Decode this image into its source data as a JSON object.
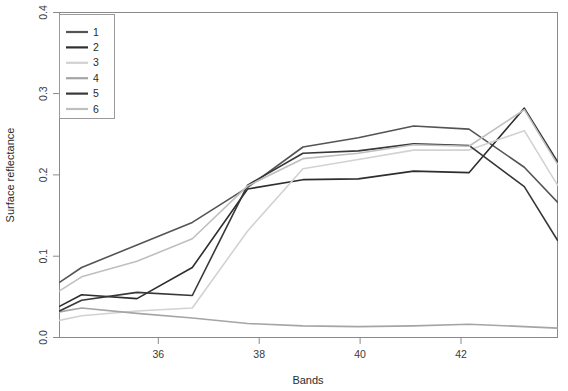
{
  "chart_data": {
    "type": "line",
    "title": "",
    "xlabel": "Bands",
    "ylabel": "Surface reflectance",
    "xlim": [
      34.6,
      43.6
    ],
    "ylim": [
      0.0,
      0.418
    ],
    "xticks": [
      36,
      38,
      40,
      42
    ],
    "xtick_labels": [
      "36",
      "38",
      "40",
      "42"
    ],
    "yticks": [
      0.0,
      0.1,
      0.2,
      0.3,
      0.4
    ],
    "ytick_labels": [
      "0.0",
      "0.1",
      "0.2",
      "0.3",
      "0.4"
    ],
    "grid": false,
    "legend_position": "top-left",
    "legend_entries": [
      "1",
      "2",
      "3",
      "4",
      "5",
      "6"
    ],
    "x": [
      34.6,
      35,
      36,
      37,
      38,
      39,
      40,
      41,
      42,
      43,
      43.6
    ],
    "series": [
      {
        "name": "1",
        "color": "#545454",
        "values": [
          0.071,
          0.09,
          0.119,
          0.148,
          0.193,
          0.245,
          0.257,
          0.272,
          0.268,
          0.219,
          0.174
        ]
      },
      {
        "name": "2",
        "color": "#2e2e2e",
        "values": [
          0.04,
          0.055,
          0.05,
          0.09,
          0.191,
          0.203,
          0.204,
          0.214,
          0.212,
          0.295,
          0.226
        ]
      },
      {
        "name": "3",
        "color": "#d2d2d2",
        "values": [
          0.022,
          0.028,
          0.034,
          0.038,
          0.137,
          0.217,
          0.229,
          0.241,
          0.241,
          0.266,
          0.196
        ]
      },
      {
        "name": "4",
        "color": "#a5a5a5",
        "values": [
          0.033,
          0.038,
          0.031,
          0.025,
          0.018,
          0.015,
          0.014,
          0.015,
          0.017,
          0.014,
          0.012
        ]
      },
      {
        "name": "5",
        "color": "#383838",
        "values": [
          0.034,
          0.048,
          0.058,
          0.054,
          0.196,
          0.237,
          0.24,
          0.249,
          0.247,
          0.194,
          0.125
        ]
      },
      {
        "name": "6",
        "color": "#bfbfbf",
        "values": [
          0.06,
          0.078,
          0.098,
          0.127,
          0.195,
          0.23,
          0.237,
          0.248,
          0.246,
          0.293,
          0.223
        ]
      }
    ]
  },
  "axes": {
    "x_title": "Bands",
    "y_title": "Surface reflectance"
  }
}
